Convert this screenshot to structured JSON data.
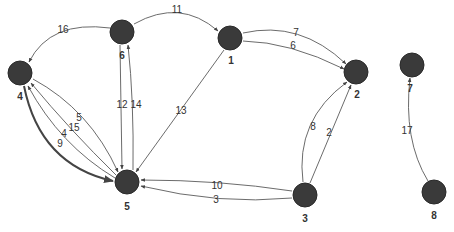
{
  "graph": {
    "type": "directed-weighted-graph",
    "nodes": [
      {
        "id": "1",
        "label": "1",
        "x": 230,
        "y": 38
      },
      {
        "id": "2",
        "label": "2",
        "x": 356,
        "y": 72
      },
      {
        "id": "3",
        "label": "3",
        "x": 305,
        "y": 195
      },
      {
        "id": "4",
        "label": "4",
        "x": 20,
        "y": 73
      },
      {
        "id": "5",
        "label": "5",
        "x": 127,
        "y": 182
      },
      {
        "id": "6",
        "label": "6",
        "x": 122,
        "y": 32
      },
      {
        "id": "7",
        "label": "7",
        "x": 412,
        "y": 65
      },
      {
        "id": "8",
        "label": "8",
        "x": 434,
        "y": 192
      }
    ],
    "edges": [
      {
        "from": "6",
        "to": "4",
        "label": "16"
      },
      {
        "from": "6",
        "to": "1",
        "label": "11"
      },
      {
        "from": "1",
        "to": "2",
        "label": "7"
      },
      {
        "from": "1",
        "to": "2",
        "label": "6"
      },
      {
        "from": "1",
        "to": "5",
        "label": "13"
      },
      {
        "from": "6",
        "to": "5",
        "label": "12"
      },
      {
        "from": "5",
        "to": "6",
        "label": "14"
      },
      {
        "from": "4",
        "to": "5",
        "label": "5"
      },
      {
        "from": "5",
        "to": "4",
        "label": "15"
      },
      {
        "from": "5",
        "to": "4",
        "label": "4"
      },
      {
        "from": "4",
        "to": "5",
        "label": "9"
      },
      {
        "from": "3",
        "to": "5",
        "label": "10"
      },
      {
        "from": "3",
        "to": "5",
        "label": "3"
      },
      {
        "from": "3",
        "to": "2",
        "label": "8"
      },
      {
        "from": "3",
        "to": "2",
        "label": "2"
      },
      {
        "from": "8",
        "to": "7",
        "label": "17"
      }
    ]
  },
  "node_labels": {
    "n1": "1",
    "n2": "2",
    "n3": "3",
    "n4": "4",
    "n5": "5",
    "n6": "6",
    "n7": "7",
    "n8": "8"
  },
  "edge_labels": {
    "e16": "16",
    "e11": "11",
    "e7": "7",
    "e6": "6",
    "e13": "13",
    "e12": "12",
    "e14": "14",
    "e5": "5",
    "e15": "15",
    "e4": "4",
    "e9": "9",
    "e10": "10",
    "e3": "3",
    "e8": "8",
    "e2": "2",
    "e17": "17"
  }
}
